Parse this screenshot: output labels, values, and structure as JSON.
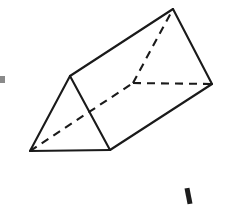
{
  "figure": {
    "name": "triangular-prism",
    "background_color": "#ffffff",
    "line_color": "#1a1a1a",
    "line_width": 2.1,
    "canvas": {
      "width": 227,
      "height": 208
    },
    "vertices": {
      "front_bottom_left": {
        "label": "A",
        "x": 30,
        "y": 151
      },
      "front_apex": {
        "label": "B",
        "x": 70,
        "y": 76
      },
      "front_bottom_right": {
        "label": "C",
        "x": 110,
        "y": 150
      },
      "back_bottom_left": {
        "label": "D",
        "x": 133,
        "y": 83,
        "hidden": true
      },
      "back_apex": {
        "label": "E",
        "x": 173,
        "y": 9
      },
      "back_bottom_right": {
        "label": "F",
        "x": 212,
        "y": 84
      }
    },
    "edges": [
      {
        "name": "front-triangle-left-side",
        "from": "A",
        "to": "B",
        "style": "solid"
      },
      {
        "name": "front-triangle-right-side",
        "from": "B",
        "to": "C",
        "style": "solid"
      },
      {
        "name": "front-triangle-base",
        "from": "A",
        "to": "C",
        "style": "solid"
      },
      {
        "name": "top-ridge-edge",
        "from": "B",
        "to": "E",
        "style": "solid"
      },
      {
        "name": "bottom-right-long-edge",
        "from": "C",
        "to": "F",
        "style": "solid"
      },
      {
        "name": "back-triangle-right-side",
        "from": "E",
        "to": "F",
        "style": "solid"
      },
      {
        "name": "hidden-long-edge",
        "from": "A",
        "to": "D",
        "style": "dashed"
      },
      {
        "name": "back-triangle-left-side",
        "from": "D",
        "to": "E",
        "style": "dashed"
      },
      {
        "name": "back-triangle-base",
        "from": "D",
        "to": "F",
        "style": "dashed"
      }
    ],
    "faces": [
      {
        "name": "front-triangular-face",
        "points": "30,151 70,76 110,150",
        "visible": true
      },
      {
        "name": "top-rectangular-face",
        "points": "30,151 70,76 173,9 133,83",
        "visible": true
      },
      {
        "name": "right-rectangular-face",
        "points": "110,150 70,76 173,9 212,84",
        "visible": true
      }
    ],
    "stray_marks": [
      {
        "name": "stray-mark-bottom-right",
        "x": 186,
        "y": 188,
        "width": 5,
        "height": 16,
        "rotation": -11,
        "tone": "dark"
      },
      {
        "name": "stray-mark-left-edge",
        "x": 0,
        "y": 76,
        "width": 5,
        "height": 7,
        "rotation": 0,
        "tone": "faint"
      }
    ]
  }
}
